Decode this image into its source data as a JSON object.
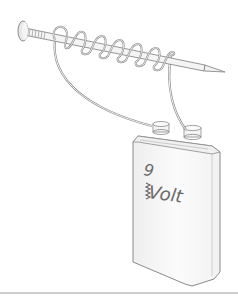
{
  "figure": {
    "battery": {
      "voltage_number": "9",
      "voltage_unit": "Volt"
    },
    "colors": {
      "outline": "#8a8a8a",
      "fill": "#f6f6f6",
      "battery_fill": "#f8f8f8",
      "label": "#6a6a6a",
      "separator": "#9a9a9a"
    },
    "components": [
      "nail",
      "wire-coil",
      "battery",
      "positive-terminal",
      "negative-terminal"
    ]
  }
}
